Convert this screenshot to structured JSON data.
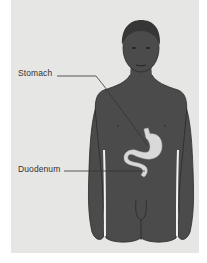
{
  "figure": {
    "labels": {
      "stomach": "Stomach",
      "duodenum": "Duodenum"
    },
    "colors": {
      "background_panel": "#e6e6e4",
      "body": "#4b4b4b",
      "body_outline": "#2a2a2a",
      "organ": "#d9d9d9",
      "leader_line": "#333333",
      "label_text": "#333333"
    }
  }
}
